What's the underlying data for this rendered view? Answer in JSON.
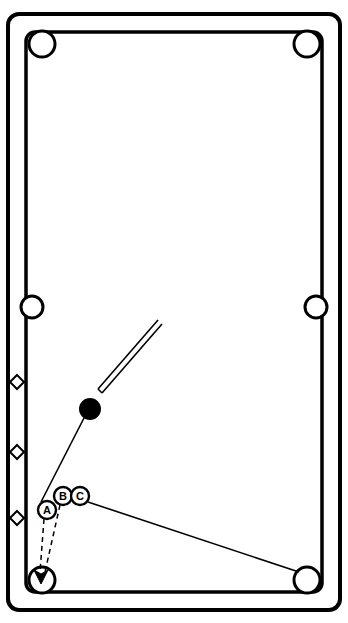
{
  "diagram": {
    "table": {
      "rail_color": "#000000",
      "cloth_color": "#ffffff",
      "outer_rect": {
        "x": 8,
        "y": 14,
        "width": 332,
        "height": 596
      },
      "inner_rect": {
        "x": 26,
        "y": 32,
        "width": 296,
        "height": 560
      },
      "corner_radius": 10
    },
    "pockets": [
      {
        "name": "pocket-top-left",
        "cx": 42,
        "cy": 44,
        "r": 13
      },
      {
        "name": "pocket-top-right",
        "cx": 307,
        "cy": 44,
        "r": 13
      },
      {
        "name": "pocket-side-left",
        "cx": 33,
        "cy": 307,
        "r": 11
      },
      {
        "name": "pocket-side-right",
        "cx": 316,
        "cy": 307,
        "r": 11
      },
      {
        "name": "pocket-bottom-left",
        "cx": 42,
        "cy": 580,
        "r": 13
      },
      {
        "name": "pocket-bottom-right",
        "cx": 307,
        "cy": 580,
        "r": 13
      }
    ],
    "rail_diamonds": [
      {
        "name": "diamond-left-1",
        "cx": 17,
        "cy": 382,
        "size": 7
      },
      {
        "name": "diamond-left-2",
        "cx": 17,
        "cy": 452,
        "size": 7
      },
      {
        "name": "diamond-left-3",
        "cx": 17,
        "cy": 518,
        "size": 7
      }
    ],
    "balls": [
      {
        "name": "cue-ball",
        "label": "",
        "cx": 90,
        "cy": 409,
        "r": 10,
        "fill": "#000000",
        "stroke": "#000000",
        "label_color": "#ffffff"
      },
      {
        "name": "object-ball-a",
        "label": "A",
        "cx": 47,
        "cy": 510,
        "r": 9,
        "fill": "#ffffff",
        "stroke": "#000000",
        "label_color": "#000000"
      },
      {
        "name": "object-ball-b",
        "label": "B",
        "cx": 63,
        "cy": 496,
        "r": 9,
        "fill": "#ffffff",
        "stroke": "#000000",
        "label_color": "#000000"
      },
      {
        "name": "object-ball-c",
        "label": "C",
        "cx": 80,
        "cy": 496,
        "r": 9,
        "fill": "#ffffff",
        "stroke": "#000000",
        "label_color": "#000000"
      }
    ],
    "cue_stick": {
      "name": "cue-stick",
      "x1": 158,
      "y1": 320,
      "x2": 96,
      "y2": 391,
      "width": 4,
      "color": "#000000"
    },
    "shot_lines": [
      {
        "name": "shot-line-cue-to-a",
        "style": "solid",
        "x1": 84,
        "y1": 418,
        "x2": 40,
        "y2": 503
      },
      {
        "name": "shot-line-c-to-corner",
        "style": "solid",
        "x1": 88,
        "y1": 502,
        "x2": 300,
        "y2": 573
      },
      {
        "name": "shot-line-a-to-pocket",
        "style": "dashed",
        "x1": 44,
        "y1": 519,
        "x2": 40,
        "y2": 574
      },
      {
        "name": "shot-line-b-to-pocket",
        "style": "dashed",
        "x1": 60,
        "y1": 505,
        "x2": 44,
        "y2": 574
      }
    ],
    "arrow": {
      "name": "pocket-arrow",
      "tip_x": 41,
      "tip_y": 582,
      "size": 9,
      "color": "#000000"
    }
  }
}
